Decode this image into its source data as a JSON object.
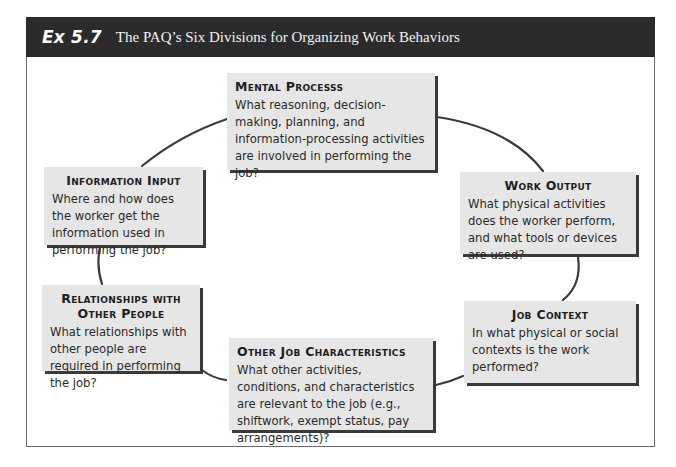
{
  "header": {
    "exhibit_label": "Ex 5.7",
    "title": "The PAQ’s Six Divisions for Organizing Work Behaviors"
  },
  "divisions": [
    {
      "title": "Mental Processs",
      "description": "What reasoning, decision-making, planning, and information-processing activities are involved in performing the job?"
    },
    {
      "title": "Work Output",
      "description": "What physical activities does the worker perform, and what tools or devices are used?"
    },
    {
      "title": "Job Context",
      "description": "In what physical or social contexts is the work performed?"
    },
    {
      "title": "Other Job Characteristics",
      "description": "What other activities, conditions, and characteristics are relevant to the job (e.g., shiftwork, exempt status, pay arrangements)?"
    },
    {
      "title": "Relationships with Other People",
      "description": "What relationships with other people are required in performing the job?"
    },
    {
      "title": "Information Input",
      "description": "Where and how does the worker get the information used in performing the job?"
    }
  ],
  "colors": {
    "header_bg": "#2b2b2b",
    "box_bg": "#e6e6e6",
    "box_shadow": "#3a3a3a",
    "connector": "#3a3a3a"
  }
}
